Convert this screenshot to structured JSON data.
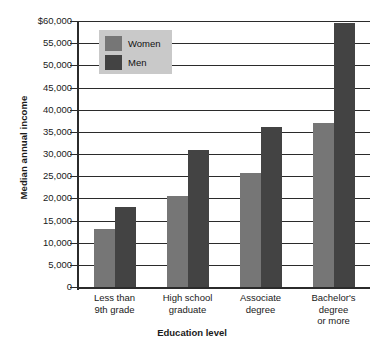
{
  "chart_data": {
    "type": "bar",
    "title": "",
    "xlabel": "Education level",
    "ylabel": "Median annual income",
    "categories": [
      "Less than\n9th grade",
      "High school\ngraduate",
      "Associate\ndegree",
      "Bachelor's\ndegree\nor more"
    ],
    "category_lines": [
      [
        "Less than",
        "9th grade"
      ],
      [
        "High school",
        "graduate"
      ],
      [
        "Associate",
        "degree"
      ],
      [
        "Bachelor's",
        "degree",
        "or more"
      ]
    ],
    "series": [
      {
        "name": "Women",
        "color": "#767676",
        "values": [
          13000,
          20500,
          25800,
          37000
        ]
      },
      {
        "name": "Men",
        "color": "#434343",
        "values": [
          18100,
          31000,
          36000,
          59500
        ]
      }
    ],
    "ylim": [
      0,
      60000
    ],
    "ytick_values": [
      60000,
      55000,
      50000,
      45000,
      40000,
      35000,
      30000,
      25000,
      20000,
      15000,
      10000,
      5000,
      0
    ],
    "ytick_labels": [
      "$60,000",
      "55,000",
      "50,000",
      "45,000",
      "40,000",
      "35,000",
      "30,000",
      "25,000",
      "20,000",
      "15,000",
      "10,000",
      "5,000",
      "0"
    ],
    "grid": true,
    "legend_position": "top-left",
    "legend_background": "#c9c9c9"
  },
  "legend": {
    "entries": [
      {
        "label": "Women"
      },
      {
        "label": "Men"
      }
    ]
  },
  "axes": {
    "y_title": "Median annual income",
    "x_title": "Education level"
  }
}
